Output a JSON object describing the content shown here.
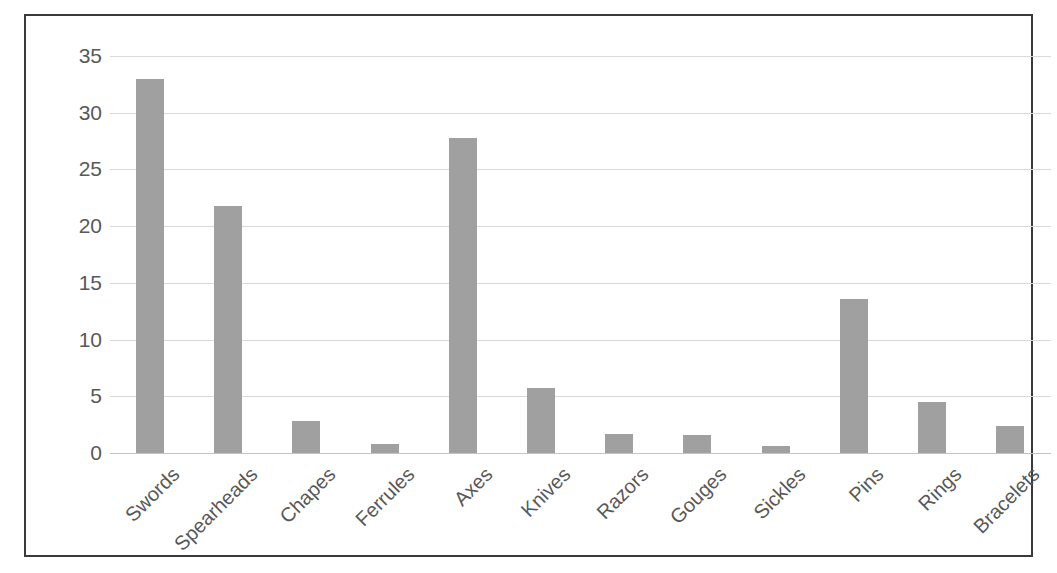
{
  "chart_data": {
    "type": "bar",
    "title": "",
    "subtitle": "",
    "xlabel": "",
    "ylabel": "",
    "ylim": [
      0,
      35
    ],
    "yticks": [
      0,
      5,
      10,
      15,
      20,
      25,
      30,
      35
    ],
    "ytick_labels": [
      "0",
      "5",
      "10",
      "15",
      "20",
      "25",
      "30",
      "35"
    ],
    "grid": true,
    "legend": false,
    "legend_position": "none",
    "orientation": "vertical",
    "bar_color": "#a0a0a0",
    "gridline_color": "#d9d9d9",
    "frame_color": "#3a3a3a",
    "tick_label_color": "#595959",
    "categories": [
      "Swords",
      "Spearheads",
      "Chapes",
      "Ferrules",
      "Axes",
      "Knives",
      "Razors",
      "Gouges",
      "Sickles",
      "Pins",
      "Rings",
      "Bracelets"
    ],
    "values": [
      33.0,
      21.8,
      2.8,
      0.8,
      27.8,
      5.7,
      1.7,
      1.6,
      0.6,
      13.6,
      4.5,
      2.4
    ]
  }
}
